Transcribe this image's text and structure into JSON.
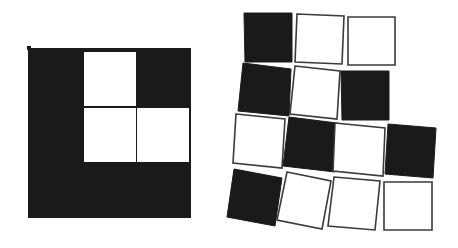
{
  "figure": {
    "colors": {
      "dark": "#1a1a1a",
      "light": "#ffffff",
      "stroke": "#3a3a3a",
      "background": "#ffffff"
    },
    "left_panel": {
      "description": "Assembled square: dark 3x3 grid with three white cells (L-tromino hole)",
      "outer": {
        "x": 28,
        "y": 48,
        "w": 163,
        "h": 170
      },
      "white_cells": [
        {
          "x": 84,
          "y": 52,
          "w": 52,
          "h": 54
        },
        {
          "x": 84,
          "y": 108,
          "w": 52,
          "h": 54
        },
        {
          "x": 137,
          "y": 108,
          "w": 52,
          "h": 54
        }
      ]
    },
    "right_panel": {
      "description": "Loose, slightly rotated tiles in 4 rows",
      "tiles": [
        {
          "fill": "dark",
          "points": "244,13 292,13 292,62 245,62"
        },
        {
          "fill": "light",
          "points": "297,14 344,16 342,64 295,62"
        },
        {
          "fill": "light",
          "points": "348,17 395,17 395,65 348,65"
        },
        {
          "fill": "dark",
          "points": "243,63 291,69 289,116 238,111"
        },
        {
          "fill": "light",
          "points": "295,66 340,71 337,119 290,114"
        },
        {
          "fill": "dark",
          "points": "341,71 389,71 389,120 342,120"
        },
        {
          "fill": "light",
          "points": "236,114 285,119 282,168 233,163"
        },
        {
          "fill": "dark",
          "points": "289,117 337,123 335,172 283,166"
        },
        {
          "fill": "light",
          "points": "335,123 385,128 383,176 333,171"
        },
        {
          "fill": "dark",
          "points": "388,124 436,128 433,178 385,174"
        },
        {
          "fill": "dark",
          "points": "234,169 282,178 275,226 227,217"
        },
        {
          "fill": "light",
          "points": "287,172 331,181 322,229 277,220"
        },
        {
          "fill": "light",
          "points": "334,177 380,181 375,230 328,226"
        },
        {
          "fill": "light",
          "points": "384,182 432,182 432,230 384,230"
        }
      ]
    }
  }
}
